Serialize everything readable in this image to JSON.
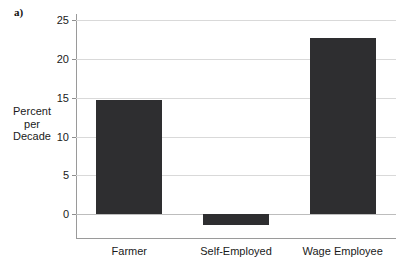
{
  "panel": {
    "letter": "a)"
  },
  "axis": {
    "y_title_lines": [
      "Percent",
      "per",
      "Decade"
    ],
    "y_ticks": [
      {
        "label": "25",
        "value": 25
      },
      {
        "label": "20",
        "value": 20
      },
      {
        "label": "15",
        "value": 15
      },
      {
        "label": "10",
        "value": 10
      },
      {
        "label": "5",
        "value": 5
      },
      {
        "label": "0",
        "value": 0
      }
    ]
  },
  "colors": {
    "bar": "#2e2e30",
    "gridline": "#d9d9d9",
    "axis": "#9a9a9a",
    "text": "#1a1a1a",
    "background": "#ffffff"
  },
  "chart_data": {
    "type": "bar",
    "title": "",
    "subtitle": "",
    "annotations": [
      "a)"
    ],
    "categories": [
      "Farmer",
      "Self-Employed",
      "Wage Employee"
    ],
    "values": [
      14.7,
      -1.4,
      22.7
    ],
    "series": [
      {
        "name": "Percent per Decade",
        "values": [
          14.7,
          -1.4,
          22.7
        ]
      }
    ],
    "xlabel": "",
    "ylabel": "Percent per Decade",
    "ylim": [
      -3.1,
      25.8
    ],
    "ytick_values": [
      0,
      5,
      10,
      15,
      20,
      25
    ],
    "ytick_labels": [
      "0",
      "5",
      "10",
      "15",
      "20",
      "25"
    ],
    "grid": true,
    "grid_axis": "y",
    "legend": false,
    "legend_position": "none",
    "bar_color": "#2e2e30"
  }
}
